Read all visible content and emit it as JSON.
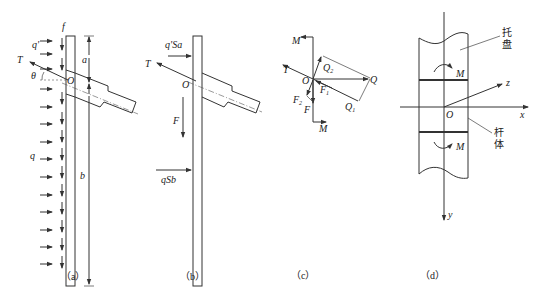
{
  "figure": {
    "panels": [
      {
        "id": "a",
        "caption": "（a）",
        "labels": {
          "f": "f",
          "q_prime": "q'",
          "T": "T",
          "theta": "θ",
          "O": "O",
          "a": "a",
          "q": "q",
          "b": "b"
        }
      },
      {
        "id": "b",
        "caption": "（b）",
        "labels": {
          "q_prime_Sa": "q'Sa",
          "T": "T",
          "O": "O",
          "F": "F",
          "qSb": "qSb"
        }
      },
      {
        "id": "c",
        "caption": "（c）",
        "labels": {
          "M_top": "M",
          "T": "T",
          "O": "O",
          "Q2": "Q",
          "Q2_sub": "2",
          "Q": "Q",
          "F1": "F",
          "F1_sub": "1",
          "F2": "F",
          "F2_sub": "2",
          "F": "F",
          "Q1": "Q",
          "Q1_sub": "1",
          "M_bottom": "M"
        }
      },
      {
        "id": "d",
        "caption": "（d）",
        "labels": {
          "tray": "托",
          "tray2": "盘",
          "M_top": "M",
          "z": "z",
          "x": "x",
          "O": "O",
          "rod": "杆",
          "rod2": "体",
          "M_bottom": "M",
          "y": "y"
        }
      }
    ]
  }
}
